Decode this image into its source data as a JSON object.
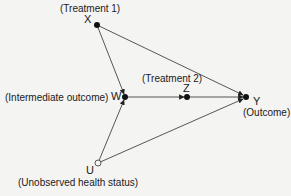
{
  "diagram": {
    "type": "causal DAG",
    "nodes": [
      {
        "id": "X",
        "label": "X",
        "description": "(Treatment 1)",
        "observed": true
      },
      {
        "id": "W",
        "label": "W",
        "description": "(Intermediate outcome)",
        "observed": true
      },
      {
        "id": "Z",
        "label": "Z",
        "description": "(Treatment 2)",
        "observed": true
      },
      {
        "id": "Y",
        "label": "Y",
        "description": "(Outcome)",
        "observed": true
      },
      {
        "id": "U",
        "label": "U",
        "description": "(Unobserved health status)",
        "observed": false
      }
    ],
    "edges": [
      {
        "from": "X",
        "to": "Y"
      },
      {
        "from": "X",
        "to": "W"
      },
      {
        "from": "W",
        "to": "Z"
      },
      {
        "from": "Z",
        "to": "Y"
      },
      {
        "from": "U",
        "to": "W"
      },
      {
        "from": "U",
        "to": "Y"
      }
    ]
  },
  "labels": {
    "x_desc": "(Treatment 1)",
    "x": "X",
    "w_desc": "(Intermediate outcome)",
    "w": "W",
    "z_desc": "(Treatment 2)",
    "z": "Z",
    "y": "Y",
    "y_desc": "(Outcome)",
    "u": "U",
    "u_desc": "(Unobserved health status)"
  }
}
